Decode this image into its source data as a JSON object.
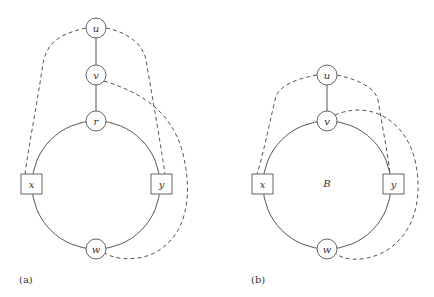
{
  "panels": [
    {
      "caption": "(a)",
      "nodes": [
        {
          "id": "u",
          "label": "u",
          "shape": "circle"
        },
        {
          "id": "v",
          "label": "v",
          "shape": "circle"
        },
        {
          "id": "r",
          "label": "r",
          "shape": "circle"
        },
        {
          "id": "x",
          "label": "x",
          "shape": "square"
        },
        {
          "id": "y",
          "label": "y",
          "shape": "square"
        },
        {
          "id": "w",
          "label": "w",
          "shape": "circle"
        }
      ],
      "solid_edges": [
        "u-v",
        "v-r",
        "cycle r-x-w-y"
      ],
      "dashed_edges": [
        "u-x",
        "u-y",
        "v-w"
      ]
    },
    {
      "caption": "(b)",
      "region_label": "B",
      "nodes": [
        {
          "id": "u",
          "label": "u",
          "shape": "circle"
        },
        {
          "id": "v",
          "label": "v",
          "shape": "circle"
        },
        {
          "id": "x",
          "label": "x",
          "shape": "square"
        },
        {
          "id": "y",
          "label": "y",
          "shape": "square"
        },
        {
          "id": "w",
          "label": "w",
          "shape": "circle"
        }
      ],
      "solid_edges": [
        "u-v",
        "cycle v-x-w-y"
      ],
      "dashed_edges": [
        "u-x",
        "u-y",
        "v-w"
      ]
    }
  ]
}
